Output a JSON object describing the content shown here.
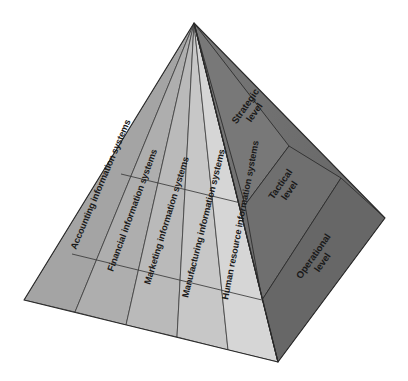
{
  "diagram": {
    "type": "3d-pyramid",
    "background_color": "#ffffff",
    "apex": {
      "x": 194,
      "y": 23
    },
    "corners": {
      "left": {
        "x": 24,
        "y": 300
      },
      "front": {
        "x": 278,
        "y": 362
      },
      "right": {
        "x": 385,
        "y": 218
      }
    },
    "left_face": {
      "name": "functional-systems-face",
      "base_color": "#a8a8a8",
      "highlight_color": "#d6d6d6",
      "segment_count": 5,
      "segments": [
        {
          "label": "Accounting information systems",
          "fill": "#a6a6a6"
        },
        {
          "label": "Financial information systems",
          "fill": "#b0b0b0"
        },
        {
          "label": "Marketing information systems",
          "fill": "#bcbcbc"
        },
        {
          "label": "Manufacturing information systems",
          "fill": "#c8c8c8"
        },
        {
          "label": "Human resource information systems",
          "fill": "#d6d6d6"
        }
      ],
      "divider_lines": 2
    },
    "right_face": {
      "name": "management-levels-face",
      "base_color": "#6e6e6e",
      "band_count": 3,
      "bands": [
        {
          "label_line1": "Strategic",
          "label_line2": "level",
          "fill": "#767676"
        },
        {
          "label_line1": "Tactical",
          "label_line2": "level",
          "fill": "#6f6f6f"
        },
        {
          "label_line1": "Operational",
          "label_line2": "level",
          "fill": "#686868"
        }
      ]
    },
    "colors": {
      "edge_stroke": "#2a2a2a",
      "divider_stroke": "#3a3a3a",
      "text": "#1a1a1a"
    }
  }
}
